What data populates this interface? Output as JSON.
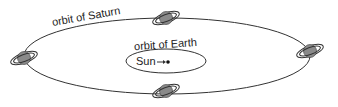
{
  "diagram": {
    "labels": {
      "outer_orbit": "orbit of Saturn",
      "inner_orbit": "orbit of Earth",
      "sun": "Sun"
    },
    "elements": {
      "outer_orbit": "Saturn's orbit ellipse",
      "inner_orbit": "Earth's orbit ellipse",
      "earth": "Earth dot next to Sun with arrow",
      "saturn_positions": [
        "top",
        "right",
        "bottom",
        "left"
      ]
    },
    "colors": {
      "line": "#333333",
      "planet_fill": "#8a8a8a",
      "background": "#ffffff"
    }
  }
}
